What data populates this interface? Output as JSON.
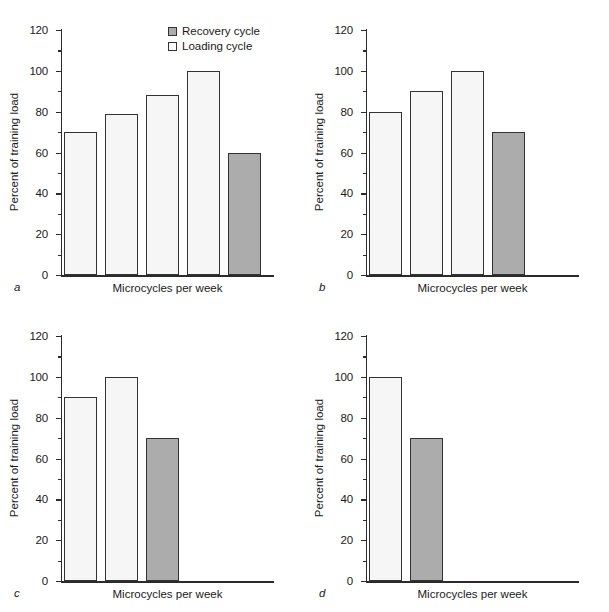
{
  "figure": {
    "axis_label_y": "Percent of training load",
    "axis_label_x": "Microcycles per week",
    "legend": {
      "recovery_label": "Recovery cycle",
      "loading_label": "Loading cycle",
      "recovery_color": "#acacac",
      "loading_color": "#ffffff"
    },
    "tick_labels": [
      "0",
      "20",
      "40",
      "60",
      "80",
      "100",
      "120"
    ],
    "panel_letters": [
      "a",
      "b",
      "c",
      "d"
    ]
  },
  "chart_data": [
    {
      "type": "bar",
      "panel": "a",
      "title": "",
      "xlabel": "Microcycles per week",
      "ylabel": "Percent of training load",
      "ylim": [
        0,
        120
      ],
      "yticks": [
        0,
        20,
        40,
        60,
        80,
        100,
        120
      ],
      "grid": false,
      "legend_position": "top-right",
      "categories": [
        "1",
        "2",
        "3",
        "4",
        "5"
      ],
      "values": [
        70,
        79,
        88,
        100,
        60
      ],
      "bar_types": [
        "loading",
        "loading",
        "loading",
        "loading",
        "recovery"
      ],
      "series": [
        {
          "name": "Loading cycle",
          "values": [
            70,
            79,
            88,
            100,
            null
          ]
        },
        {
          "name": "Recovery cycle",
          "values": [
            null,
            null,
            null,
            null,
            60
          ]
        }
      ]
    },
    {
      "type": "bar",
      "panel": "b",
      "title": "",
      "xlabel": "Microcycles per week",
      "ylabel": "Percent of training load",
      "ylim": [
        0,
        120
      ],
      "yticks": [
        0,
        20,
        40,
        60,
        80,
        100,
        120
      ],
      "grid": false,
      "categories": [
        "1",
        "2",
        "3",
        "4"
      ],
      "values": [
        80,
        90,
        100,
        70
      ],
      "bar_types": [
        "loading",
        "loading",
        "loading",
        "recovery"
      ],
      "series": [
        {
          "name": "Loading cycle",
          "values": [
            80,
            90,
            100,
            null
          ]
        },
        {
          "name": "Recovery cycle",
          "values": [
            null,
            null,
            null,
            70
          ]
        }
      ]
    },
    {
      "type": "bar",
      "panel": "c",
      "title": "",
      "xlabel": "Microcycles per week",
      "ylabel": "Percent of training load",
      "ylim": [
        0,
        120
      ],
      "yticks": [
        0,
        20,
        40,
        60,
        80,
        100,
        120
      ],
      "grid": false,
      "categories": [
        "1",
        "2",
        "3"
      ],
      "values": [
        90,
        100,
        70
      ],
      "bar_types": [
        "loading",
        "loading",
        "recovery"
      ],
      "series": [
        {
          "name": "Loading cycle",
          "values": [
            90,
            100,
            null
          ]
        },
        {
          "name": "Recovery cycle",
          "values": [
            null,
            null,
            70
          ]
        }
      ]
    },
    {
      "type": "bar",
      "panel": "d",
      "title": "",
      "xlabel": "Microcycles per week",
      "ylabel": "Percent of training load",
      "ylim": [
        0,
        120
      ],
      "yticks": [
        0,
        20,
        40,
        60,
        80,
        100,
        120
      ],
      "grid": false,
      "categories": [
        "1",
        "2"
      ],
      "values": [
        100,
        70
      ],
      "bar_types": [
        "loading",
        "recovery"
      ],
      "series": [
        {
          "name": "Loading cycle",
          "values": [
            100,
            null
          ]
        },
        {
          "name": "Recovery cycle",
          "values": [
            null,
            70
          ]
        }
      ]
    }
  ]
}
